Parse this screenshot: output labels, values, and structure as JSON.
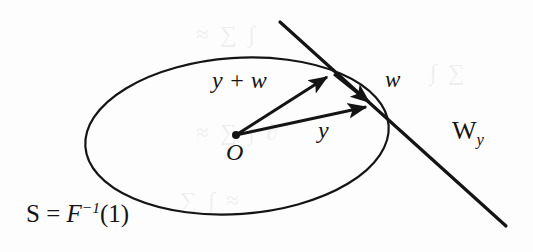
{
  "figure": {
    "kind": "mathematical-diagram",
    "caption_free": true,
    "background_color": "#fdfdfd",
    "ink_color": "#141414"
  },
  "labels": {
    "level_set": {
      "full_text": "S = F−1(1)",
      "lead_symbol": "S",
      "equals": " = ",
      "map_symbol": "F",
      "exponent": "−1",
      "argument": "(1)"
    },
    "vector_sum": "y + w",
    "tangent_vector": "w",
    "position_vector": "y",
    "origin": "O",
    "tangent_space": {
      "full_text": "W y",
      "base": "W",
      "subscript": "y"
    }
  },
  "geometry": {
    "ellipse": {
      "center_x": 237,
      "center_y": 136,
      "radius_x": 152,
      "radius_y": 78,
      "rotation_deg": -4,
      "stroke": "#141414",
      "stroke_width": 2.2
    },
    "tangent_line": {
      "x1": 280,
      "y1": 22,
      "x2": 506,
      "y2": 226,
      "stroke_width": 3.2
    },
    "origin_dot": {
      "cx": 236,
      "cy": 135,
      "r": 4
    },
    "arrow_y": {
      "x1": 236,
      "y1": 135,
      "x2": 374,
      "y2": 106
    },
    "arrow_y_plus_w": {
      "x1": 236,
      "y1": 135,
      "x2": 333,
      "y2": 73
    },
    "arrow_w": {
      "x1": 333,
      "y1": 73,
      "x2": 374,
      "y2": 106
    }
  },
  "ghost_text": {
    "top": "≈ ∑ ∫",
    "middle": "≈ ∑ ∫ ∂",
    "bottom": "∑ ∫ ≈",
    "right": "∫ ∑"
  }
}
